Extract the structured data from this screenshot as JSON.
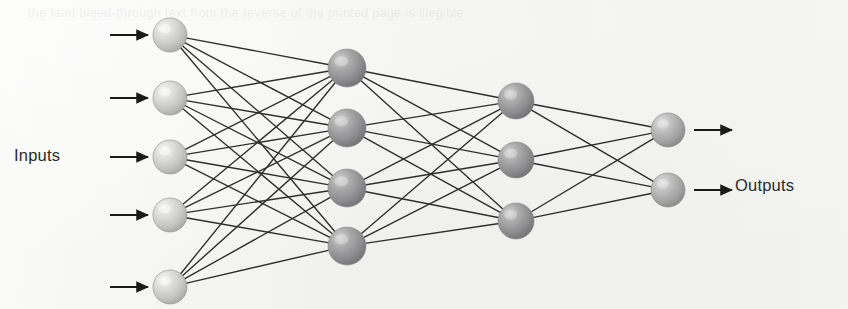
{
  "figure": {
    "kind": "neural-network-diagram",
    "background_color": "#f3f3f1",
    "ghost_text": "the faint bleed-through text from the reverse of the printed page is illegible"
  },
  "labels": {
    "inputs": "Inputs",
    "outputs": "Outputs"
  },
  "style": {
    "edge_color": "#2f2f2f",
    "edge_width": 1.4,
    "arrow_color": "#1a1a1a",
    "input_node_fill": "#c9c9c7",
    "input_node_highlight": "#eeeeec",
    "hidden_node_fill": "#8f8f90",
    "hidden_node_highlight": "#c6c6c6",
    "output_node_fill": "#a8a8a8",
    "output_node_highlight": "#d8d8d8",
    "node_stroke": "#8a8a8a"
  },
  "chart_data": {
    "type": "diagram",
    "layer_sizes": [
      5,
      4,
      3,
      2
    ],
    "fully_connected": true,
    "edge_counts": [
      20,
      12,
      6
    ],
    "total_edges": 38,
    "total_nodes": 14,
    "layers": [
      {
        "name": "input-layer",
        "role": "input",
        "count": 5,
        "x": 170,
        "radius": 17,
        "fill": "#c9c9c7",
        "nodes": [
          {
            "id": "i1",
            "cx": 170,
            "cy": 35
          },
          {
            "id": "i2",
            "cx": 170,
            "cy": 98
          },
          {
            "id": "i3",
            "cx": 170,
            "cy": 157
          },
          {
            "id": "i4",
            "cx": 170,
            "cy": 215
          },
          {
            "id": "i5",
            "cx": 170,
            "cy": 287
          }
        ]
      },
      {
        "name": "hidden-layer-1",
        "role": "hidden",
        "count": 4,
        "x": 347,
        "radius": 19,
        "fill": "#8f8f90",
        "nodes": [
          {
            "id": "h1_1",
            "cx": 347,
            "cy": 68
          },
          {
            "id": "h1_2",
            "cx": 347,
            "cy": 128
          },
          {
            "id": "h1_3",
            "cx": 347,
            "cy": 188
          },
          {
            "id": "h1_4",
            "cx": 347,
            "cy": 246
          }
        ]
      },
      {
        "name": "hidden-layer-2",
        "role": "hidden",
        "count": 3,
        "x": 516,
        "radius": 18,
        "fill": "#8f8f90",
        "nodes": [
          {
            "id": "h2_1",
            "cx": 516,
            "cy": 101
          },
          {
            "id": "h2_2",
            "cx": 516,
            "cy": 160
          },
          {
            "id": "h2_3",
            "cx": 516,
            "cy": 221
          }
        ]
      },
      {
        "name": "output-layer",
        "role": "output",
        "count": 2,
        "x": 668,
        "radius": 17,
        "fill": "#a8a8a8",
        "nodes": [
          {
            "id": "o1",
            "cx": 668,
            "cy": 130
          },
          {
            "id": "o2",
            "cx": 668,
            "cy": 190
          }
        ]
      }
    ],
    "input_arrows": [
      {
        "id": "in-arrow-1",
        "x1": 110,
        "x2": 148,
        "y": 35
      },
      {
        "id": "in-arrow-2",
        "x1": 110,
        "x2": 148,
        "y": 98
      },
      {
        "id": "in-arrow-3",
        "x1": 110,
        "x2": 148,
        "y": 157
      },
      {
        "id": "in-arrow-4",
        "x1": 110,
        "x2": 148,
        "y": 215
      },
      {
        "id": "in-arrow-5",
        "x1": 110,
        "x2": 148,
        "y": 287
      }
    ],
    "output_arrows": [
      {
        "id": "out-arrow-1",
        "x1": 694,
        "x2": 732,
        "y": 130
      },
      {
        "id": "out-arrow-2",
        "x1": 694,
        "x2": 732,
        "y": 190
      }
    ],
    "annotations": [
      {
        "id": "inputs-label",
        "text": "Inputs",
        "x": 14,
        "y": 157
      },
      {
        "id": "outputs-label",
        "text": "Outputs",
        "x": 735,
        "y": 188
      }
    ]
  }
}
